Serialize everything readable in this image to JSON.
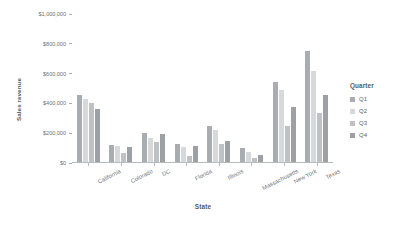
{
  "chart_data": {
    "type": "bar",
    "title": "",
    "xlabel": "State",
    "ylabel": "Sales revenue",
    "legend_title": "Quarter",
    "legend_position": "right",
    "grid": false,
    "ylim": [
      0,
      1000000
    ],
    "ytick_values": [
      0,
      200000,
      400000,
      600000,
      800000,
      1000000
    ],
    "ytick_labels": [
      "$0",
      "$200,000",
      "$400,000",
      "$600,000",
      "$800,000",
      "$1,000,000"
    ],
    "categories": [
      "California",
      "Colorado",
      "DC",
      "Florida",
      "Illinois",
      "Massachusetts",
      "New York",
      "Texas"
    ],
    "series": [
      {
        "name": "Q1",
        "color": "#a9adb1",
        "values": [
          452000,
          115000,
          196000,
          118000,
          244000,
          95000,
          540000,
          748000
        ]
      },
      {
        "name": "Q2",
        "color": "#d6d8da",
        "values": [
          421000,
          110000,
          158000,
          103000,
          215000,
          68000,
          486000,
          612000
        ]
      },
      {
        "name": "Q3",
        "color": "#bfc2c5",
        "values": [
          393000,
          62000,
          133000,
          42000,
          120000,
          28000,
          245000,
          330000
        ]
      },
      {
        "name": "Q4",
        "color": "#9da1a5",
        "values": [
          358000,
          98000,
          185000,
          110000,
          142000,
          45000,
          372000,
          452000
        ]
      }
    ]
  },
  "legend": {
    "title": "Quarter",
    "entries": [
      "Q1",
      "Q2",
      "Q3",
      "Q4"
    ]
  },
  "axes": {
    "x_title": "State",
    "y_title": "Sales revenue"
  }
}
